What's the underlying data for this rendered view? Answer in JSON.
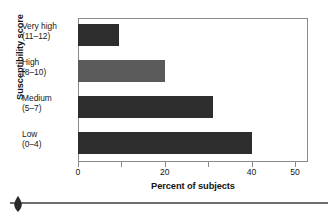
{
  "chart_data": {
    "type": "bar",
    "orientation": "horizontal",
    "title": "",
    "xlabel": "Percent of subjects",
    "ylabel": "Susceptibility score",
    "categories": [
      "Very high (11–12)",
      "High (8–10)",
      "Medium (5–7)",
      "Low (0–4)"
    ],
    "category_lines": [
      {
        "line1": "Very high",
        "line2": "(11–12)"
      },
      {
        "line1": "High",
        "line2": "(8–10)"
      },
      {
        "line1": "Medium",
        "line2": "(5–7)"
      },
      {
        "line1": "Low",
        "line2": "(0–4)"
      }
    ],
    "values": [
      9.5,
      20,
      31,
      40
    ],
    "bar_colors": [
      "#2d2d2d",
      "#5a5a5a",
      "#2d2d2d",
      "#2d2d2d"
    ],
    "xlim": [
      0,
      53
    ],
    "xticks": [
      0,
      10,
      20,
      30,
      40,
      50
    ],
    "xtick_labels": [
      "0",
      "",
      "20",
      "",
      "40",
      "50"
    ],
    "grid": false,
    "legend": "none",
    "frame_color": "#8a8a8a"
  },
  "axes": {
    "y_title": "Susceptibility score",
    "x_title": "Percent of subjects"
  },
  "ornament": {
    "shape": "teardrop-diamond",
    "color": "#2b2b2b",
    "rule_color": "#6e6e6e"
  }
}
